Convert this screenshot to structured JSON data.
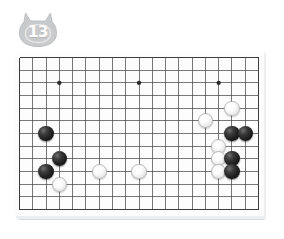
{
  "badge": {
    "icon": "cat-head-badge",
    "number": "13",
    "fill_color": "#c9cacb",
    "text_color": "#ffffff"
  },
  "board": {
    "name": "go-board",
    "columns": 19,
    "rows": 13,
    "line_color": "#4a4a4a",
    "background_color": "#fdfdfd",
    "frame_color": "#3c3c3c",
    "star_point_color": "#2b2b2b",
    "star_points": [
      {
        "col": 3,
        "row": 2
      },
      {
        "col": 9,
        "row": 2
      },
      {
        "col": 15,
        "row": 2
      },
      {
        "col": 9,
        "row": 9
      }
    ],
    "stones": [
      {
        "color": "black",
        "col": 2,
        "row": 6
      },
      {
        "color": "black",
        "col": 3,
        "row": 8
      },
      {
        "color": "black",
        "col": 2,
        "row": 9
      },
      {
        "color": "white",
        "col": 3,
        "row": 10
      },
      {
        "color": "white",
        "col": 6,
        "row": 9
      },
      {
        "color": "white",
        "col": 9,
        "row": 9
      },
      {
        "color": "white",
        "col": 16,
        "row": 4
      },
      {
        "color": "white",
        "col": 14,
        "row": 5
      },
      {
        "color": "black",
        "col": 16,
        "row": 6
      },
      {
        "color": "black",
        "col": 17,
        "row": 6
      },
      {
        "color": "white",
        "col": 15,
        "row": 7
      },
      {
        "color": "white",
        "col": 15,
        "row": 8
      },
      {
        "color": "black",
        "col": 16,
        "row": 8
      },
      {
        "color": "white",
        "col": 15,
        "row": 9
      },
      {
        "color": "black",
        "col": 16,
        "row": 9
      }
    ]
  },
  "colors": {
    "page_background": "#ffffff",
    "board_shadow": "#d8dade",
    "stone_black": "#1c1c1c",
    "stone_white": "#fbfbfb"
  }
}
